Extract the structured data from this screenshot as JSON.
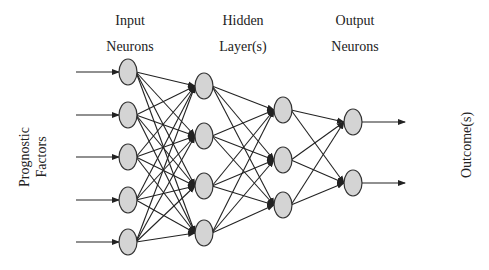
{
  "labels": {
    "input_line1": "Input",
    "input_line2": "Neurons",
    "hidden_line1": "Hidden",
    "hidden_line2": "Layer(s)",
    "output_line1": "Output",
    "output_line2": "Neurons",
    "left_line1": "Prognostic",
    "left_line2": "Factors",
    "right": "Outcome(s)"
  },
  "colors": {
    "neuron_fill": "#d4d4d4",
    "neuron_stroke": "#333333",
    "line": "#222222",
    "text": "#222222"
  },
  "layers": [
    {
      "name": "input",
      "x": 128,
      "nodes": [
        72,
        115,
        157,
        200,
        242
      ]
    },
    {
      "name": "hidden1",
      "x": 204,
      "nodes": [
        86,
        136,
        186,
        233
      ]
    },
    {
      "name": "hidden2",
      "x": 283,
      "nodes": [
        110,
        160,
        205
      ]
    },
    {
      "name": "output",
      "x": 353,
      "nodes": [
        122,
        183
      ]
    }
  ],
  "input_arrows": {
    "x_start": 76
  },
  "output_arrows": {
    "x_end": 405
  }
}
